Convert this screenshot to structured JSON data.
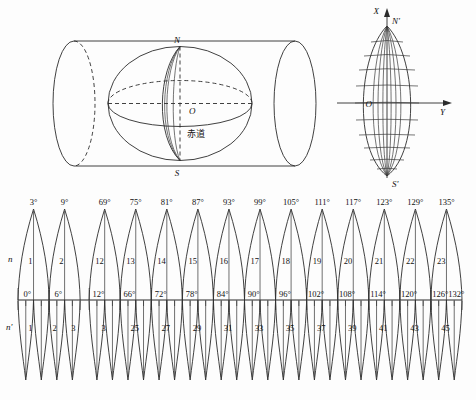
{
  "figure": {
    "background_color": "#fdfdfd",
    "line_color": "#2b2b2b"
  },
  "panel_globe": {
    "name": "sphere-in-transverse-cylinder",
    "labels": {
      "north_pole": "N",
      "south_pole": "S",
      "center": "O",
      "equator": "赤道"
    }
  },
  "panel_gore": {
    "name": "projected-zone-graticule",
    "labels": {
      "axis_x": "X",
      "axis_y": "Y",
      "north_pole": "N'",
      "south_pole": "S'",
      "origin": "O"
    },
    "meridian_count": 7,
    "parallel_count": 11
  },
  "strips": {
    "upper": {
      "row_label": "n",
      "zone_width_deg": 6,
      "zones": [
        {
          "number": "1",
          "central_meridian": "3°",
          "left": "0°",
          "right": "6°"
        },
        {
          "number": "2",
          "central_meridian": "9°",
          "left": "6°",
          "right": "12°"
        },
        {
          "number": "12",
          "central_meridian": "69°",
          "left": "66°",
          "right": "72°"
        },
        {
          "number": "13",
          "central_meridian": "75°",
          "left": "72°",
          "right": "78°"
        },
        {
          "number": "14",
          "central_meridian": "81°",
          "left": "78°",
          "right": "84°"
        },
        {
          "number": "15",
          "central_meridian": "87°",
          "left": "84°",
          "right": "90°"
        },
        {
          "number": "16",
          "central_meridian": "93°",
          "left": "90°",
          "right": "96°"
        },
        {
          "number": "17",
          "central_meridian": "99°",
          "left": "96°",
          "right": "102°"
        },
        {
          "number": "18",
          "central_meridian": "105°",
          "left": "102°",
          "right": "108°"
        },
        {
          "number": "19",
          "central_meridian": "111°",
          "left": "108°",
          "right": "114°"
        },
        {
          "number": "20",
          "central_meridian": "117°",
          "left": "114°",
          "right": "120°"
        },
        {
          "number": "21",
          "central_meridian": "123°",
          "left": "120°",
          "right": "126°"
        },
        {
          "number": "22",
          "central_meridian": "129°",
          "left": "126°",
          "right": "132°"
        },
        {
          "number": "23",
          "central_meridian": "135°",
          "left": "132°",
          "right": "138°"
        }
      ]
    },
    "axis_degree_labels": [
      "0°",
      "6°",
      "12°",
      "66°",
      "72°",
      "78°",
      "84°",
      "90°",
      "96°",
      "102°",
      "108°",
      "114°",
      "120°",
      "126°",
      "132°",
      "138°"
    ],
    "lower": {
      "row_label": "n'",
      "zone_width_deg": 3,
      "labeled_zones": [
        "1",
        "2",
        "3",
        "25",
        "27",
        "29",
        "31",
        "33",
        "35",
        "37",
        "39",
        "41",
        "43",
        "45"
      ]
    },
    "break_between": [
      "12°",
      "66°"
    ]
  }
}
